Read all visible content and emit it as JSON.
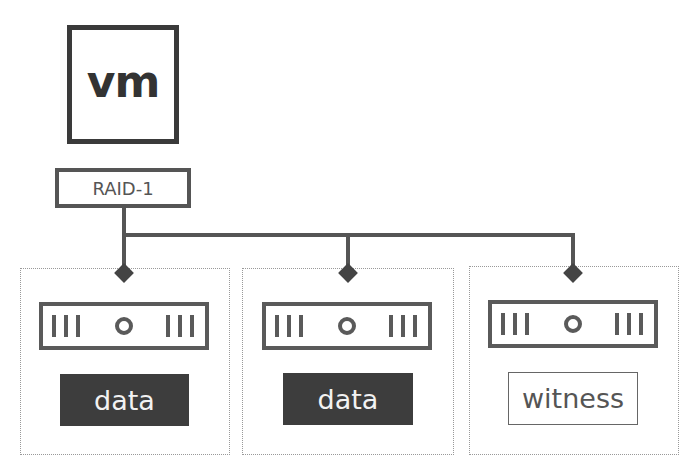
{
  "vm": {
    "label": "vm"
  },
  "raid": {
    "label": "RAID-1"
  },
  "hosts": [
    {
      "component_label": "data",
      "component_type": "data",
      "drive_icon": "disk-drive-icon"
    },
    {
      "component_label": "data",
      "component_type": "data",
      "drive_icon": "disk-drive-icon"
    },
    {
      "component_label": "witness",
      "component_type": "witness",
      "drive_icon": "disk-drive-icon"
    }
  ],
  "colors": {
    "stroke": "#555555",
    "data_fill": "#3d3d3d",
    "data_text": "#f2f2f2",
    "witness_text": "#555555"
  }
}
